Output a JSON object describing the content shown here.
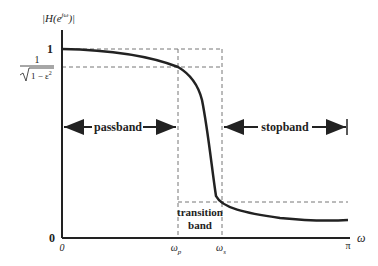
{
  "y_axis": {
    "label_main": "|H(e",
    "label_sup": "jω",
    "label_end": ")|",
    "tick_one": "1",
    "tick_ripple_num": "1",
    "tick_ripple_den": "1 − ε",
    "tick_ripple_sup": "2",
    "tick_zero": "0"
  },
  "x_axis": {
    "label": "ω",
    "tick_origin": "0",
    "tick_wp": "ω",
    "tick_wp_sub": "p",
    "tick_ws": "ω",
    "tick_ws_sub": "s",
    "tick_pi": "π"
  },
  "bands": {
    "passband": "passband",
    "stopband": "stopband",
    "transition_line1": "transition",
    "transition_line2": "band"
  },
  "colors": {
    "curve": "#222222",
    "axis": "#222222",
    "dashed": "#777777"
  }
}
